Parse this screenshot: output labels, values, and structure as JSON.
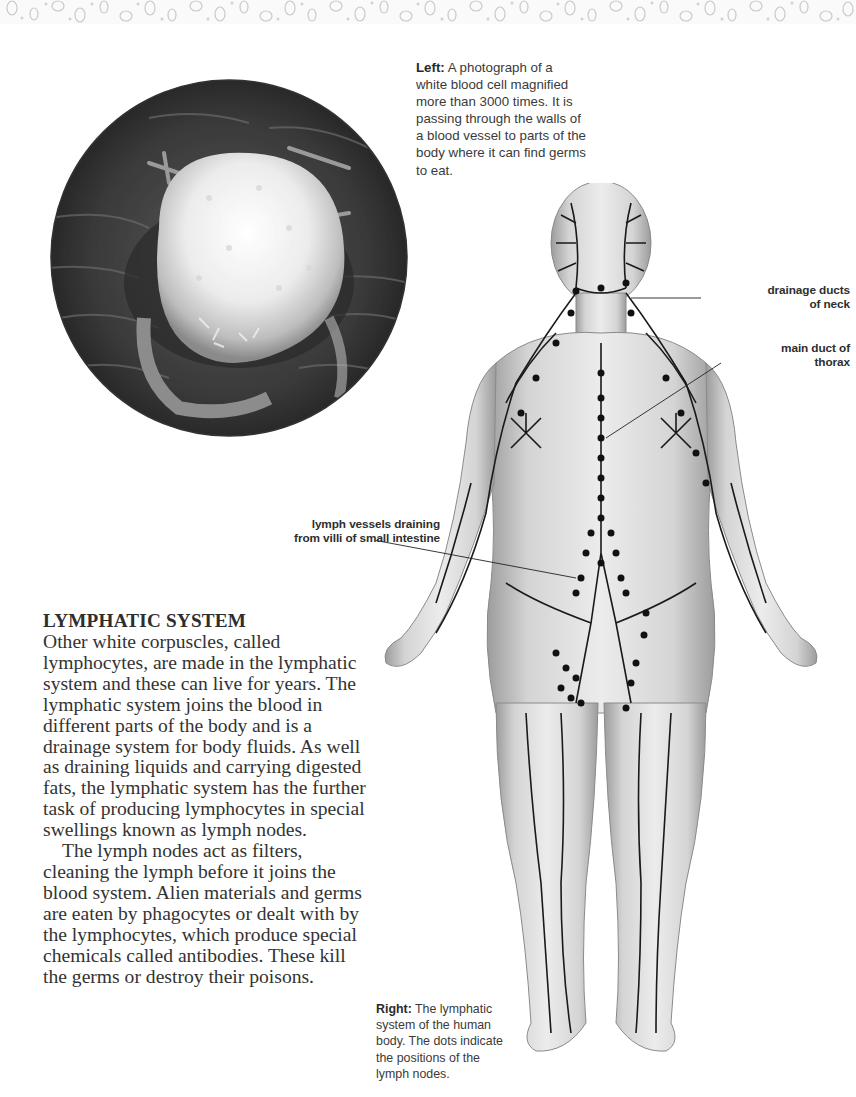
{
  "page": {
    "background": "#ffffff",
    "top_band": {
      "pattern": "cell-pattern-texture",
      "color": "#cfcfcf"
    }
  },
  "photo": {
    "alt": "Electron micrograph of a white blood cell passing through a blood vessel wall",
    "shape": "circle"
  },
  "captions": {
    "left": {
      "lead": "Left:",
      "text": " A photograph of a white blood cell magnified more than 3000 times. It is passing through the walls of a blood vessel to parts of the body where it can find germs to eat."
    },
    "right": {
      "lead": "Right:",
      "text": " The lymphatic system of the human body. The dots indicate the positions of the lymph nodes."
    }
  },
  "diagram_labels": {
    "neck": {
      "line1": "drainage ducts",
      "line2": "of neck"
    },
    "thorax": {
      "line1": "main duct of",
      "line2": "thorax"
    },
    "villi": {
      "line1": "lymph vessels draining",
      "line2": "from villi of small intestine"
    }
  },
  "article": {
    "heading": "LYMPHATIC SYSTEM",
    "paragraphs": [
      "Other white corpuscles, called lymphocytes, are made in the lymphatic system and these can live for years. The lymphatic system joins the blood in different parts of the body and is a drainage system for body fluids. As well as draining liquids and carrying digested fats, the lymphatic system has the further task of producing lymphocytes in special swellings known as lymph nodes.",
      "The lymph nodes act as filters, cleaning the lymph before it joins the blood system. Alien materials and germs are eaten by phagocytes or dealt with by the lymphocytes, which produce special chemicals called antibodies. These kill the germs or destroy their poisons."
    ]
  }
}
